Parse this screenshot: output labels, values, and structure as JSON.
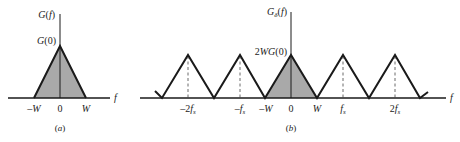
{
  "panel_a": {
    "y_label": "G(f)",
    "peak_label": "G(0)",
    "x_axis_label": "f",
    "ticks": [
      "-W",
      "0",
      "W"
    ],
    "caption": "(a)"
  },
  "panel_b": {
    "y_label": "Gδ(f)",
    "peak_label": "2WG(0)",
    "x_axis_label": "f",
    "ticks": [
      "-2fs",
      "-fs",
      "-W",
      "0",
      "W",
      "fs",
      "2fs"
    ],
    "caption": "(b)"
  },
  "colors": {
    "line": "#1a1a1a",
    "fill": "#a9a9a9",
    "background": "#ffffff"
  }
}
